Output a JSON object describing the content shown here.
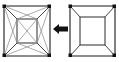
{
  "figure": {
    "background_color": "#ffffff",
    "canvas": {
      "width": 119,
      "height": 62
    }
  },
  "left_mesh": {
    "label": "triangulated-frustum-mesh",
    "caption": "",
    "outer_square": {
      "x": 4,
      "y": 6,
      "width": 46,
      "height": 50
    },
    "inner_square": {
      "x": 17,
      "y": 19,
      "width": 20,
      "height": 24
    },
    "edge_color": "#1a1a1a",
    "diagonal_color": "#8f8f8f",
    "vertex_color": "#111111",
    "face_count": 12,
    "has_diagonals": "true"
  },
  "arrow": {
    "label": "leftward-transform-arrow",
    "direction": "left",
    "color": "#111111",
    "x": 53,
    "y": 24,
    "width": 15,
    "height": 10
  },
  "right_mesh": {
    "label": "quad-frustum-mesh",
    "caption": "",
    "outer_square": {
      "x": 70,
      "y": 6,
      "width": 45,
      "height": 50
    },
    "inner_square": {
      "x": 80,
      "y": 17,
      "width": 25,
      "height": 28
    },
    "edge_color": "#1a1a1a",
    "diagonal_color": "#3a3a3a",
    "vertex_color": "#111111",
    "face_count": 4,
    "has_diagonals": "false"
  }
}
